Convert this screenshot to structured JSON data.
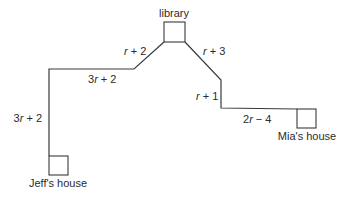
{
  "diagram": {
    "type": "route-map",
    "locations": {
      "library": {
        "label": "library"
      },
      "jeff": {
        "label": "Jeff's house"
      },
      "mia": {
        "label": "Mia's house"
      }
    },
    "segments": [
      {
        "id": "jeff-vertical",
        "coef": "3",
        "var": "r",
        "op": " + ",
        "const": "2",
        "full": "3r + 2"
      },
      {
        "id": "jeff-horizontal",
        "coef": "3",
        "var": "r",
        "op": " + ",
        "const": "2",
        "full": "3r + 2"
      },
      {
        "id": "left-diagonal",
        "coef": "",
        "var": "r",
        "op": " + ",
        "const": "2",
        "full": "r + 2"
      },
      {
        "id": "right-diagonal",
        "coef": "",
        "var": "r",
        "op": " + ",
        "const": "3",
        "full": "r + 3"
      },
      {
        "id": "mia-vertical",
        "coef": "",
        "var": "r",
        "op": " + ",
        "const": "1",
        "full": "r + 1"
      },
      {
        "id": "mia-horizontal",
        "coef": "2",
        "var": "r",
        "op": " − ",
        "const": "4",
        "full": "2r − 4"
      }
    ],
    "colors": {
      "line": "#3a3a3a",
      "text": "#2b2b2b",
      "background": "#ffffff"
    }
  }
}
